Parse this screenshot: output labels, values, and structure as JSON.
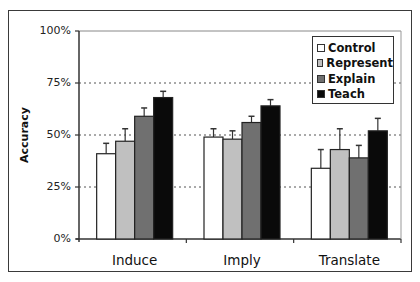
{
  "chart_data": {
    "type": "bar",
    "title": "",
    "xlabel": "",
    "ylabel": "Accuracy",
    "ylim": [
      0,
      100
    ],
    "yticks": [
      "0%",
      "25%",
      "50%",
      "75%",
      "100%"
    ],
    "grid": "dotted horizontal at 25%, 50%, 75%",
    "legend_position": "upper right, inside plot",
    "categories": [
      "Induce",
      "Imply",
      "Translate"
    ],
    "series": [
      {
        "name": "Control",
        "color": "#ffffff",
        "values": [
          41,
          49,
          34
        ],
        "error_upper": [
          46,
          53,
          43
        ]
      },
      {
        "name": "Represent",
        "color": "#c0c0c0",
        "values": [
          47,
          48,
          43
        ],
        "error_upper": [
          53,
          52,
          53
        ]
      },
      {
        "name": "Explain",
        "color": "#707070",
        "values": [
          59,
          56,
          39
        ],
        "error_upper": [
          63,
          59,
          45
        ]
      },
      {
        "name": "Teach",
        "color": "#0a0a0a",
        "values": [
          68,
          64,
          52
        ],
        "error_upper": [
          71,
          67,
          58
        ]
      }
    ]
  },
  "axis": {
    "ylabel": "Accuracy",
    "ticks": [
      "0%",
      "25%",
      "50%",
      "75%",
      "100%"
    ]
  },
  "legend": [
    "Control",
    "Represent",
    "Explain",
    "Teach"
  ]
}
